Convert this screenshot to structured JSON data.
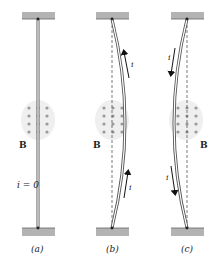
{
  "colors": {
    "support": "#b3b3b3",
    "support_edge": "#8a8a8a",
    "wire": "#555555",
    "wire_fill": "#ffffff",
    "field_region": "#eeeeee",
    "field_dot": "#9a9a9a",
    "arrow": "#111111",
    "dashed": "#444444",
    "text": "#222222"
  },
  "panels": [
    {
      "id": "a",
      "caption": "(a)",
      "field_label": "B",
      "current_label": "i = 0",
      "wire_shape": "straight",
      "current_direction": "none"
    },
    {
      "id": "b",
      "caption": "(b)",
      "field_label": "B",
      "current_label_top": "i",
      "current_label_bottom": "i",
      "wire_shape": "bowed-right",
      "current_direction": "up"
    },
    {
      "id": "c",
      "caption": "(c)",
      "field_label": "B",
      "current_label_top": "i",
      "current_label_bottom": "i",
      "wire_shape": "bowed-left",
      "current_direction": "down"
    }
  ],
  "field": {
    "direction": "out-of-page",
    "symbol": "dots",
    "rows": 4,
    "cols": 3
  }
}
